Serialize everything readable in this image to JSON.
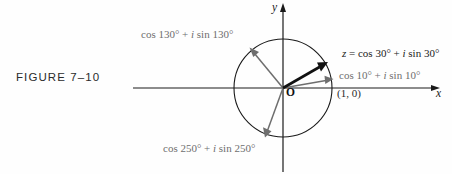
{
  "figure": {
    "caption": "FIGURE 7–10",
    "background_color": "#fefefe"
  },
  "axes": {
    "x_label": "x",
    "y_label": "y",
    "origin_label": "O",
    "x_axis_color": "#1a1a1a",
    "y_axis_color": "#1a1a1a",
    "x_range_px": [
      133,
      437
    ],
    "y_range_px": [
      4,
      172
    ]
  },
  "unit_circle": {
    "center_px": [
      283,
      88
    ],
    "radius_px": 49,
    "stroke_color": "#1a1a1a",
    "point_on_axis_label": "(1, 0)"
  },
  "vectors": [
    {
      "name": "vector-130",
      "angle_deg": 130,
      "label": "cos 130° + i sin 130°",
      "color": "#6e6e6e",
      "emphasis": "normal"
    },
    {
      "name": "vector-30",
      "angle_deg": 30,
      "label": "z = cos 30° + i sin 30°",
      "color": "#111111",
      "emphasis": "bold"
    },
    {
      "name": "vector-10",
      "angle_deg": 10,
      "label": "cos 10° + i sin 10°",
      "color": "#6e6e6e",
      "emphasis": "normal"
    },
    {
      "name": "vector-250",
      "angle_deg": 250,
      "label": "cos 250° + i sin 250°",
      "color": "#6e6e6e",
      "emphasis": "normal"
    }
  ],
  "labels": {
    "deg130_pre": "cos 130° + ",
    "deg130_i": "i",
    "deg130_post": " sin 130°",
    "deg250_pre": "cos 250° + ",
    "deg250_i": "i",
    "deg250_post": " sin 250°",
    "z30_z": "z",
    "z30_eq": " = cos 30° + ",
    "z30_i": "i",
    "z30_post": " sin 30°",
    "deg10_pre": "cos 10° + ",
    "deg10_i": "i",
    "deg10_post": " sin 10°",
    "point_1_0": "(1, 0)"
  }
}
